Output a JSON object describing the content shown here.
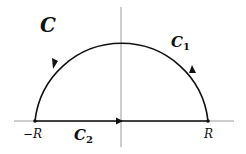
{
  "diagram": {
    "contour_label": "C",
    "arc_label": "C",
    "arc_subscript": "1",
    "segment_label": "C",
    "segment_subscript": "2",
    "left_point_label": "−R",
    "right_point_label": "R",
    "colors": {
      "contour": "#111111",
      "axes": "#9a9a9a",
      "background": "#ffffff"
    },
    "orientation": "counterclockwise",
    "arrows": [
      {
        "on": "arc-left",
        "direction": "down-left"
      },
      {
        "on": "arc-right",
        "direction": "up"
      },
      {
        "on": "segment",
        "direction": "right"
      }
    ]
  }
}
